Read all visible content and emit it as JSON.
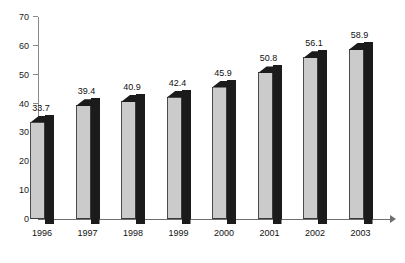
{
  "chart_data": {
    "type": "bar",
    "title": "",
    "subtitle": "",
    "xlabel": "",
    "ylabel": "",
    "categories": [
      "1996",
      "1997",
      "1998",
      "1999",
      "2000",
      "2001",
      "2002",
      "2003"
    ],
    "values": [
      33.7,
      39.4,
      40.9,
      42.4,
      45.9,
      50.8,
      56.1,
      58.9
    ],
    "value_labels": [
      "33.7",
      "39.4",
      "40.9",
      "42.4",
      "45.9",
      "50.8",
      "56.1",
      "58.9"
    ],
    "ylim": [
      0,
      70
    ],
    "y_ticks": [
      0,
      10,
      20,
      30,
      40,
      50,
      60,
      70
    ],
    "y_tick_labels": [
      "0",
      "10",
      "20",
      "30",
      "40",
      "50",
      "60",
      "70"
    ],
    "grid": false,
    "legend": null,
    "series": [
      {
        "name": "",
        "values": [
          33.7,
          39.4,
          40.9,
          42.4,
          45.9,
          50.8,
          56.1,
          58.9
        ]
      }
    ],
    "style": {
      "bar_front_color": "#cbcbcb",
      "bar_shade_color": "#1b1b1b",
      "axis_color": "#8a8a8a",
      "text_color": "#111111",
      "background": "#ffffff",
      "three_d": true
    }
  }
}
